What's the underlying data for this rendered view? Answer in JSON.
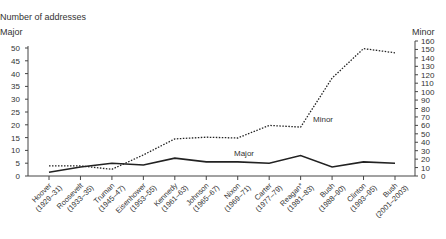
{
  "chart_data": {
    "type": "line",
    "title": "Number of addresses",
    "y_left_label": "Major",
    "y_right_label": "Minor",
    "ylim_left": [
      0,
      50
    ],
    "ylim_right": [
      0,
      160
    ],
    "yticks_left": [
      0,
      5,
      10,
      15,
      20,
      25,
      30,
      35,
      40,
      45,
      50
    ],
    "yticks_right": [
      0,
      10,
      20,
      30,
      40,
      50,
      60,
      70,
      80,
      90,
      100,
      110,
      120,
      130,
      140,
      150,
      160
    ],
    "grid": false,
    "categories": [
      "Hoover (1929–31)",
      "Roosevelt (1933–35)",
      "Truman (1945–47)",
      "Eisenhower (1953–55)",
      "Kennedy (1961–63)",
      "Johnson (1965–67)",
      "Nixon (1969–71)",
      "Carter (1977–79)",
      "Reagan* (1981–83)",
      "Bush (1988–90)",
      "Clinton (1993–95)",
      "Bush (2001–2003)"
    ],
    "category_names": [
      "Hoover",
      "Roosevelt",
      "Truman",
      "Eisenhower",
      "Kennedy",
      "Johnson",
      "Nixon",
      "Carter",
      "Reagan*",
      "Bush",
      "Clinton",
      "Bush"
    ],
    "category_years": [
      "(1929–31)",
      "(1933–35)",
      "(1945–47)",
      "(1953–55)",
      "(1961–63)",
      "(1965–67)",
      "(1969–71)",
      "(1977–79)",
      "(1981–83)",
      "(1988–90)",
      "(1993–95)",
      "(2001–2003)"
    ],
    "series": [
      {
        "name": "Major",
        "axis": "left",
        "style": "solid",
        "values": [
          1.5,
          3.5,
          5,
          4.3,
          7,
          5.5,
          5.5,
          5,
          8,
          3.5,
          5.5,
          5
        ]
      },
      {
        "name": "Minor",
        "axis": "right",
        "style": "dotted",
        "values": [
          12,
          12,
          8,
          25,
          44,
          46,
          45,
          60,
          58,
          116,
          151,
          146
        ]
      }
    ],
    "annotations": [
      {
        "text": "Major",
        "near": "Carter"
      },
      {
        "text": "Minor",
        "near": "Reagan*"
      }
    ]
  }
}
